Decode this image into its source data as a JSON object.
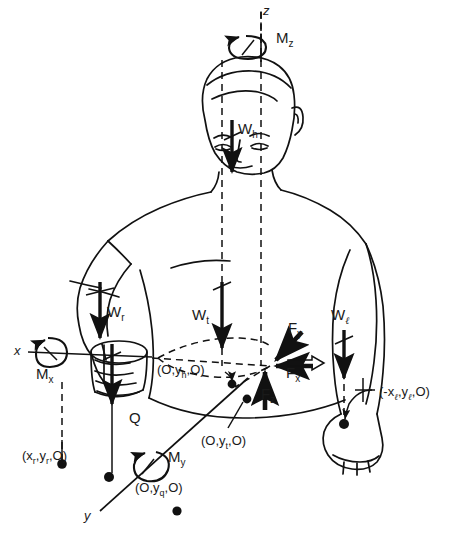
{
  "figure": {
    "ink_color": "#111111",
    "background": "#ffffff"
  },
  "axes": [
    {
      "id": "z-axis",
      "label": "z",
      "orientation": "vertical-up",
      "label_x": 263,
      "label_y": 6
    },
    {
      "id": "x-axis",
      "label": "x",
      "orientation": "horizontal-left",
      "label_x": 16,
      "label_y": 350
    },
    {
      "id": "y-axis",
      "label": "y",
      "orientation": "diagonal-down-left",
      "label_x": 86,
      "label_y": 515
    }
  ],
  "moments": [
    {
      "id": "moment-z",
      "label": "M",
      "sub": "z",
      "label_x": 276,
      "label_y": 37,
      "pivot_x": 244,
      "pivot_y": 47
    },
    {
      "id": "moment-x",
      "label": "M",
      "sub": "x",
      "label_x": 38,
      "label_y": 371,
      "pivot_x": 50,
      "pivot_y": 353
    },
    {
      "id": "moment-y",
      "label": "M",
      "sub": "y",
      "label_x": 168,
      "label_y": 455,
      "pivot_x": 147,
      "pivot_y": 468
    }
  ],
  "forces": [
    {
      "id": "force-x",
      "label": "F",
      "sub": "x",
      "label_x": 286,
      "label_y": 371,
      "direction": "horizontal-left"
    },
    {
      "id": "force-y",
      "label": "F",
      "sub": "y",
      "label_x": 288,
      "label_y": 326,
      "direction": "diagonal-down-left"
    },
    {
      "id": "force-z",
      "label": "F",
      "sub": "z",
      "label_x": 263,
      "label_y": 392,
      "direction": "vertical-up"
    }
  ],
  "weights": [
    {
      "id": "weight-head",
      "label": "W",
      "sub": "h",
      "label_x": 238,
      "label_y": 127,
      "direction": "down"
    },
    {
      "id": "weight-right-arm",
      "label": "W",
      "sub": "r",
      "label_x": 107,
      "label_y": 310,
      "direction": "down"
    },
    {
      "id": "weight-trunk",
      "label": "W",
      "sub": "t",
      "label_x": 194,
      "label_y": 313,
      "direction": "down"
    },
    {
      "id": "weight-left-arm",
      "label": "W",
      "sub": "ℓ",
      "label_x": 333,
      "label_y": 313,
      "direction": "down"
    },
    {
      "id": "load-q",
      "label": "Q",
      "sub": "",
      "label_x": 131,
      "label_y": 417,
      "direction": "down"
    }
  ],
  "coordinates": [
    {
      "id": "coord-head",
      "text": "(O,y",
      "sub": "h",
      "text_end": ",O)",
      "label_x": 159,
      "label_y": 369
    },
    {
      "id": "coord-trunk",
      "text": "(O,y",
      "sub": "t",
      "text_end": ",O)",
      "label_x": 203,
      "label_y": 440
    },
    {
      "id": "coord-right",
      "text": "(x",
      "sub": "r",
      "mid": ",y",
      "sub2": "r",
      "text_end": ",O)",
      "label_x": 24,
      "label_y": 455
    },
    {
      "id": "coord-load",
      "text": "(O,y",
      "sub": "q",
      "text_end": ",O)",
      "label_x": 137,
      "label_y": 487
    },
    {
      "id": "coord-left",
      "text": "(-x",
      "sub": "ℓ",
      "mid": ",y",
      "sub2": "ℓ",
      "text_end": ",O)",
      "label_x": 381,
      "label_y": 391
    }
  ],
  "markers": [
    {
      "id": "marker-head-cg",
      "x": 232,
      "y": 384
    },
    {
      "id": "marker-trunk-cg",
      "x": 247,
      "y": 399
    },
    {
      "id": "marker-right-cg",
      "x": 62,
      "y": 464
    },
    {
      "id": "marker-load-cg",
      "x": 109,
      "y": 477
    },
    {
      "id": "marker-left-cg",
      "x": 344,
      "y": 424
    },
    {
      "id": "marker-origin",
      "x": 270,
      "y": 366
    }
  ]
}
